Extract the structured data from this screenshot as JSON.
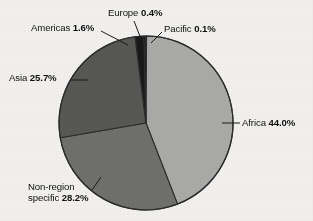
{
  "chart_data": {
    "type": "pie",
    "title": "",
    "subtitle": "",
    "xlabel": "",
    "ylabel": "",
    "legend_position": "none",
    "grid": false,
    "units": "percent",
    "start_angle_deg": 0,
    "direction": "clockwise",
    "categories": [
      "Pacific",
      "Africa",
      "Non-region specific",
      "Asia",
      "Americas",
      "Europe"
    ],
    "values": [
      0.1,
      44.0,
      28.2,
      25.7,
      1.6,
      0.4
    ],
    "slices": [
      {
        "name": "Pacific",
        "label": "Pacific",
        "value": 0.1,
        "value_text": "0.1%",
        "color": "#2a2a2a",
        "leader_line": true
      },
      {
        "name": "Africa",
        "label": "Africa",
        "value": 44.0,
        "value_text": "44.0%",
        "color": "#a9a9a7",
        "leader_line": true
      },
      {
        "name": "Non-region specific",
        "label": "Non-region specific",
        "label_line1": "Non-region",
        "label_line2": "specific",
        "value": 28.2,
        "value_text": "28.2%",
        "color": "#6f6f6d",
        "leader_line": true
      },
      {
        "name": "Asia",
        "label": "Asia",
        "value": 25.7,
        "value_text": "25.7%",
        "color": "#575755",
        "leader_line": true
      },
      {
        "name": "Americas",
        "label": "Americas",
        "value": 1.6,
        "value_text": "1.6%",
        "color": "#191919",
        "leader_line": true
      },
      {
        "name": "Europe",
        "label": "Europe",
        "value": 0.4,
        "value_text": "0.4%",
        "color": "#232323",
        "leader_line": true
      }
    ],
    "total": 100.0,
    "background_color": "#f1f0ee",
    "outline_color": "#2b2b2b"
  },
  "labels": {
    "europe": {
      "name": "Europe",
      "value": "0.4%"
    },
    "americas": {
      "name": "Americas",
      "value": "1.6%"
    },
    "pacific": {
      "name": "Pacific",
      "value": "0.1%"
    },
    "asia": {
      "name": "Asia",
      "value": "25.7%"
    },
    "africa": {
      "name": "Africa",
      "value": "44.0%"
    },
    "nonregion": {
      "name_line1": "Non-region",
      "name_line2": "specific",
      "value": "28.2%"
    }
  }
}
